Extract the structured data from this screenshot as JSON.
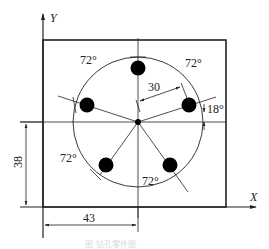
{
  "diagram": {
    "type": "engineering drawing - bolt hole circle",
    "axes": {
      "x_label": "X",
      "y_label": "Y"
    },
    "center_offset": {
      "x": "43",
      "y": "38"
    },
    "pitch_circle_radius": "30",
    "holes": {
      "count": 5,
      "start_angle": "18°",
      "spacing": "72°"
    },
    "angle_labels": [
      "72°",
      "72°",
      "72°",
      "72°"
    ],
    "start_angle_label": "18°",
    "radius_label": "30",
    "dim_x_label": "43",
    "dim_y_label": "38",
    "caption": "图 钻孔零件图"
  },
  "colors": {
    "line": "#222222",
    "hole": "#000000",
    "caption": "#d8d8d8"
  }
}
